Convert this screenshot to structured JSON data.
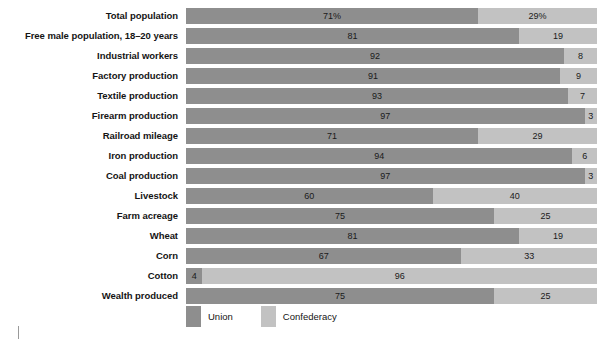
{
  "chart_data": {
    "type": "bar",
    "subtype": "horizontal-stacked-100",
    "title": "",
    "subtitle": "",
    "xlabel": "",
    "ylabel": "",
    "xlim": [
      0,
      100
    ],
    "grid": false,
    "legend_position": "bottom-left",
    "categories": [
      "Total population",
      "Free male population, 18–20 years",
      "Industrial workers",
      "Factory production",
      "Textile production",
      "Firearm production",
      "Railroad mileage",
      "Iron production",
      "Coal production",
      "Livestock",
      "Farm acreage",
      "Wheat",
      "Corn",
      "Cotton",
      "Wealth produced"
    ],
    "series": [
      {
        "name": "Union",
        "color": "#8e8e8e",
        "values": [
          71,
          81,
          92,
          91,
          93,
          97,
          71,
          94,
          97,
          60,
          75,
          81,
          67,
          4,
          75
        ],
        "labels": [
          "71%",
          "81",
          "92",
          "91",
          "93",
          "97",
          "71",
          "94",
          "97",
          "60",
          "75",
          "81",
          "67",
          "4",
          "75"
        ]
      },
      {
        "name": "Confederacy",
        "color": "#c2c2c2",
        "values": [
          29,
          19,
          8,
          9,
          7,
          3,
          29,
          6,
          3,
          40,
          25,
          19,
          33,
          96,
          25
        ],
        "labels": [
          "29%",
          "19",
          "8",
          "9",
          "7",
          "3",
          "29",
          "6",
          "3",
          "40",
          "25",
          "19",
          "33",
          "96",
          "25"
        ]
      }
    ]
  },
  "rows": [
    {
      "label": "Total population",
      "union": 71,
      "confederacy": 29,
      "union_label": "71%",
      "confederacy_label": "29%"
    },
    {
      "label": "Free male population, 18–20 years",
      "union": 81,
      "confederacy": 19,
      "union_label": "81",
      "confederacy_label": "19"
    },
    {
      "label": "Industrial workers",
      "union": 92,
      "confederacy": 8,
      "union_label": "92",
      "confederacy_label": "8"
    },
    {
      "label": "Factory production",
      "union": 91,
      "confederacy": 9,
      "union_label": "91",
      "confederacy_label": "9"
    },
    {
      "label": "Textile production",
      "union": 93,
      "confederacy": 7,
      "union_label": "93",
      "confederacy_label": "7"
    },
    {
      "label": "Firearm production",
      "union": 97,
      "confederacy": 3,
      "union_label": "97",
      "confederacy_label": "3"
    },
    {
      "label": "Railroad mileage",
      "union": 71,
      "confederacy": 29,
      "union_label": "71",
      "confederacy_label": "29"
    },
    {
      "label": "Iron production",
      "union": 94,
      "confederacy": 6,
      "union_label": "94",
      "confederacy_label": "6"
    },
    {
      "label": "Coal production",
      "union": 97,
      "confederacy": 3,
      "union_label": "97",
      "confederacy_label": "3"
    },
    {
      "label": "Livestock",
      "union": 60,
      "confederacy": 40,
      "union_label": "60",
      "confederacy_label": "40"
    },
    {
      "label": "Farm acreage",
      "union": 75,
      "confederacy": 25,
      "union_label": "75",
      "confederacy_label": "25"
    },
    {
      "label": "Wheat",
      "union": 81,
      "confederacy": 19,
      "union_label": "81",
      "confederacy_label": "19"
    },
    {
      "label": "Corn",
      "union": 67,
      "confederacy": 33,
      "union_label": "67",
      "confederacy_label": "33"
    },
    {
      "label": "Cotton",
      "union": 4,
      "confederacy": 96,
      "union_label": "4",
      "confederacy_label": "96"
    },
    {
      "label": "Wealth produced",
      "union": 75,
      "confederacy": 25,
      "union_label": "75",
      "confederacy_label": "25"
    }
  ],
  "legend": {
    "items": [
      {
        "label": "Union",
        "color": "#8e8e8e"
      },
      {
        "label": "Confederacy",
        "color": "#c2c2c2"
      }
    ]
  },
  "colors": {
    "union": "#8e8e8e",
    "confederacy": "#c2c2c2",
    "label_text": "#141414",
    "value_text": "#1a1a1a",
    "background": "#ffffff"
  }
}
